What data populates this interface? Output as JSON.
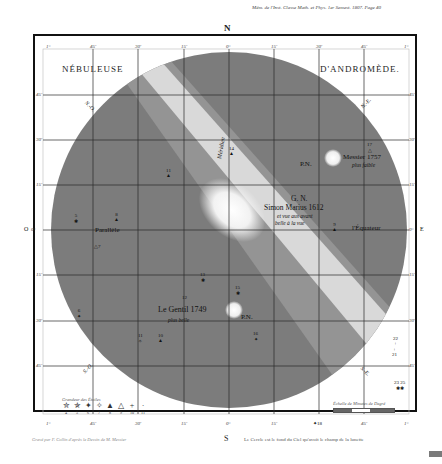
{
  "header": {
    "reference": "Mém. de l'Inst. Classe Math. et Phys. 1er Semest. 1807. Page 40",
    "north": "N",
    "south": "S",
    "east": "E",
    "west": "O"
  },
  "title": {
    "left": "NÉBULEUSE",
    "right": "D'ANDROMÈDE."
  },
  "ticks": {
    "top": [
      "1°",
      "45'",
      "30'",
      "15'",
      "0°",
      "15'",
      "30'",
      "45'",
      "1°"
    ],
    "bottom": [
      "1°",
      "45'",
      "30'",
      "15'",
      "0°",
      "15'",
      "30'",
      "45'",
      "1°"
    ],
    "left": [
      "1°",
      "45'",
      "30'",
      "15'",
      "0°",
      "15'",
      "30'",
      "45'",
      "1°"
    ],
    "right": [
      "1°",
      "45'",
      "30'",
      "15'",
      "0°",
      "15'",
      "30'",
      "45'",
      "1°"
    ]
  },
  "diagonals": {
    "no": "N.-O.",
    "ne": "N.-E.",
    "so": "S.-O.",
    "se": "S.-E."
  },
  "labels": {
    "meridian": "Méridien",
    "parallel": "Parallèle",
    "equator": "l'Équateur",
    "messier_name": "Messier 1757",
    "messier_note": "plus faible",
    "messier_pn": "P.N.",
    "center_gn": "G. N.",
    "center_name": "Simon Marius 1612",
    "center_note1": "et vue aus avant",
    "center_note2": "belle à la vue",
    "legentil_name": "Le Gentil 1749",
    "legentil_note": "plus belle",
    "legentil_pn": "P.N."
  },
  "stars": [
    {
      "num": "5",
      "x": 78,
      "y": 220
    },
    {
      "num": "8",
      "x": 118,
      "y": 219
    },
    {
      "num": "7",
      "x": 98,
      "y": 250
    },
    {
      "num": "11",
      "x": 171,
      "y": 175
    },
    {
      "num": "14",
      "x": 234,
      "y": 153
    },
    {
      "num": "17",
      "x": 372,
      "y": 149
    },
    {
      "num": "9",
      "x": 337,
      "y": 228
    },
    {
      "num": "13",
      "x": 205,
      "y": 279
    },
    {
      "num": "15",
      "x": 240,
      "y": 292
    },
    {
      "num": "12",
      "x": 187,
      "y": 300
    },
    {
      "num": "6",
      "x": 81,
      "y": 315
    },
    {
      "num": "11",
      "x": 143,
      "y": 340
    },
    {
      "num": "10",
      "x": 163,
      "y": 340
    },
    {
      "num": "16",
      "x": 258,
      "y": 338
    },
    {
      "num": "22",
      "x": 397,
      "y": 343
    },
    {
      "num": "21",
      "x": 396,
      "y": 354
    },
    {
      "num": "23 25",
      "x": 400,
      "y": 385
    },
    {
      "num": "18",
      "x": 319,
      "y": 426
    }
  ],
  "legend": {
    "title": "Grandeur des Étoiles",
    "items": [
      {
        "glyph": "✮",
        "mag": "4"
      },
      {
        "glyph": "✯",
        "mag": "5"
      },
      {
        "glyph": "✦",
        "mag": "6"
      },
      {
        "glyph": "✧",
        "mag": "7"
      },
      {
        "glyph": "▲",
        "mag": "8"
      },
      {
        "glyph": "△",
        "mag": "9"
      },
      {
        "glyph": "+",
        "mag": "10"
      },
      {
        "glyph": "·",
        "mag": "11"
      }
    ]
  },
  "scale": {
    "title": "Échelle de Minutes de Degré"
  },
  "credits": {
    "engraver": "Gravé par F. Collin d'après le Dessin de M. Messier",
    "note": "Le Cercle est le fond du Ciel qu'avoit le champ de la lunette"
  },
  "colors": {
    "disc": "#7a7a7a",
    "milkyband": "#e6e6e6",
    "frame": "#111111",
    "grid": "#2a2a2a"
  }
}
